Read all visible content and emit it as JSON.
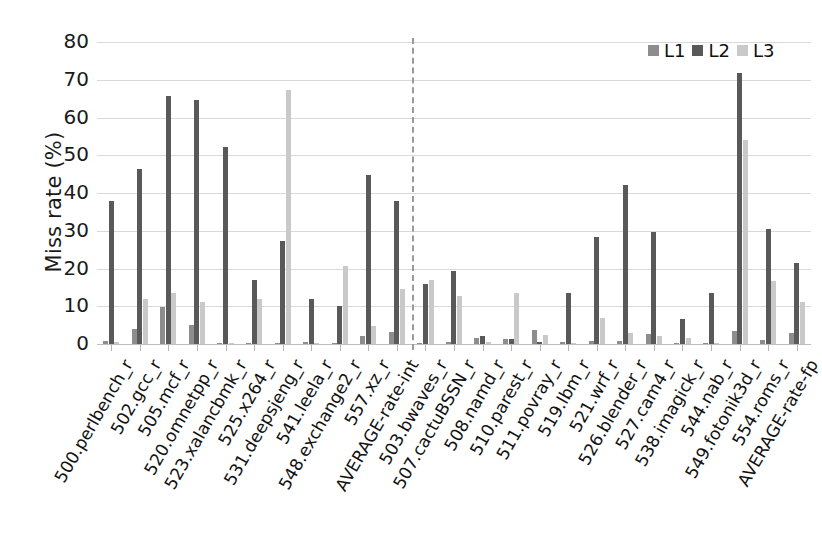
{
  "chart_data": {
    "type": "bar",
    "title": "",
    "xlabel": "",
    "ylabel": "Miss rate (%)",
    "ylim": [
      0,
      80
    ],
    "yticks": [
      80,
      70,
      60,
      50,
      40,
      30,
      20,
      10,
      0
    ],
    "grid": true,
    "legend_position": "top-right",
    "colors": {
      "L1": "#8d8d8d",
      "L2": "#595959",
      "L3": "#c9c9c9"
    },
    "divider_after_category": "AVERAGE-rate-int",
    "categories": [
      "500.perlbench_r",
      "502.gcc_r",
      "505.mcf_r",
      "520.omnetpp_r",
      "523.xalancbmk_r",
      "525.x264_r",
      "531.deepsjeng_r",
      "541.leela_r",
      "548.exchange2_r",
      "557.xz_r",
      "AVERAGE-rate-int",
      "503.bwaves_r",
      "507.cactuBSSN_r",
      "508.namd_r",
      "510.parest_r",
      "511.povray_r",
      "519.lbm_r",
      "521.wrf_r",
      "526.blender_r",
      "527.cam4_r",
      "538.imagick_r",
      "544.nab_r",
      "549.fotonik3d_r",
      "554.roms_r",
      "AVERAGE-rate-fp"
    ],
    "series": [
      {
        "name": "L1",
        "values": [
          0.9,
          3.9,
          9.8,
          5.0,
          0.2,
          0.3,
          0.3,
          0.5,
          0.2,
          2.0,
          3.2,
          0.4,
          0.5,
          1.6,
          1.2,
          3.8,
          0.5,
          0.9,
          0.8,
          2.7,
          0.4,
          0.2,
          3.5,
          1.0,
          2.9
        ]
      },
      {
        "name": "L2",
        "values": [
          37.8,
          46.4,
          65.6,
          64.7,
          52.3,
          16.9,
          27.3,
          11.9,
          10.0,
          44.7,
          37.8,
          15.9,
          19.4,
          2.2,
          1.3,
          0.6,
          13.6,
          28.3,
          42.1,
          29.6,
          6.6,
          13.6,
          71.9,
          30.6,
          21.5
        ]
      },
      {
        "name": "L3",
        "values": [
          0.6,
          11.9,
          13.6,
          11.2,
          0.2,
          11.9,
          67.4,
          0.2,
          20.6,
          4.9,
          14.5,
          16.9,
          12.8,
          0.6,
          13.4,
          2.4,
          0.4,
          7.0,
          3.0,
          2.1,
          1.5,
          0.3,
          54.0,
          16.6,
          11.2
        ]
      }
    ]
  },
  "legend": {
    "entries": [
      {
        "label": "L1",
        "color": "#8d8d8d"
      },
      {
        "label": "L2",
        "color": "#595959"
      },
      {
        "label": "L3",
        "color": "#c9c9c9"
      }
    ]
  },
  "axis": {
    "y_title": "Miss rate (%)",
    "y_tick_labels": [
      "80",
      "70",
      "60",
      "50",
      "40",
      "30",
      "20",
      "10",
      "0"
    ]
  }
}
